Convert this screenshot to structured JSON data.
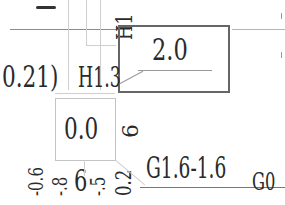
{
  "drawing": {
    "top_mark": "‒",
    "h1_label": "H1",
    "boxed_value_top": "2.0",
    "left_label": "0.21)",
    "h13_label": "H1.3",
    "boxed_value_mid": "0.0",
    "rotated_six": "6",
    "bottom_rotated_labels": [
      "-0.6",
      "-.8",
      "6",
      "-.5",
      "0.2"
    ],
    "g_label": "G1.6-1.6",
    "g0_label": "G0"
  }
}
